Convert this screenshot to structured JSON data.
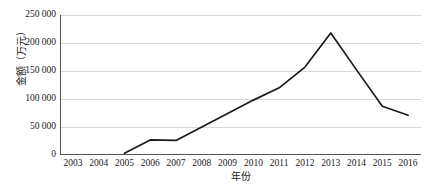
{
  "chart_data": {
    "type": "line",
    "title": "",
    "xlabel": "年份",
    "ylabel": "金额（万元）",
    "categories": [
      "2003",
      "2004",
      "2005",
      "2006",
      "2007",
      "2008",
      "2009",
      "2010",
      "2011",
      "2012",
      "2013",
      "2014",
      "2015",
      "2016"
    ],
    "series": [
      {
        "name": "金额",
        "values": [
          null,
          null,
          3000,
          27000,
          26000,
          50000,
          74000,
          98000,
          120000,
          157000,
          218000,
          152000,
          87000,
          71000
        ]
      }
    ],
    "ylim": [
      0,
      250000
    ],
    "yticks": [
      0,
      50000,
      100000,
      150000,
      200000,
      250000
    ],
    "ytick_labels": [
      "0",
      "50 000",
      "100 000",
      "150 000",
      "200 000",
      "250 000"
    ],
    "grid": true,
    "grid_axis": "y",
    "legend": false,
    "line_color": "#1a1a1a",
    "grid_color": "#d9d9d9",
    "axis_color": "#808080",
    "background": "#ffffff"
  }
}
